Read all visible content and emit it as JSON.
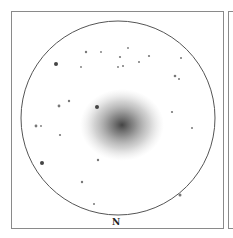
{
  "sketch": {
    "subject": "galaxy-eyepiece-sketch",
    "orientation_label": "N",
    "field_circle": {
      "cx": 118,
      "cy": 118,
      "r": 97,
      "stroke": "#555555"
    },
    "galaxy": {
      "cx": 122,
      "cy": 125,
      "rx": 42,
      "ry": 36,
      "core_color": "#3a3a3a"
    },
    "stars": [
      {
        "x": 86,
        "y": 52,
        "r": 1.2
      },
      {
        "x": 101,
        "y": 52,
        "r": 0.9
      },
      {
        "x": 128,
        "y": 48,
        "r": 0.9
      },
      {
        "x": 120,
        "y": 57,
        "r": 1.1
      },
      {
        "x": 149,
        "y": 56,
        "r": 1.1
      },
      {
        "x": 181,
        "y": 58,
        "r": 1.0
      },
      {
        "x": 56,
        "y": 64,
        "r": 2.0
      },
      {
        "x": 81,
        "y": 67,
        "r": 0.9
      },
      {
        "x": 118,
        "y": 67,
        "r": 0.9
      },
      {
        "x": 123,
        "y": 66,
        "r": 1.0
      },
      {
        "x": 139,
        "y": 62,
        "r": 1.0
      },
      {
        "x": 175,
        "y": 76,
        "r": 1.3
      },
      {
        "x": 179,
        "y": 79,
        "r": 1.0
      },
      {
        "x": 69,
        "y": 101,
        "r": 1.2
      },
      {
        "x": 59,
        "y": 106,
        "r": 1.4
      },
      {
        "x": 97,
        "y": 107,
        "r": 2.0
      },
      {
        "x": 172,
        "y": 112,
        "r": 1.1
      },
      {
        "x": 36,
        "y": 126,
        "r": 1.4
      },
      {
        "x": 41,
        "y": 126,
        "r": 0.9
      },
      {
        "x": 192,
        "y": 128,
        "r": 1.0
      },
      {
        "x": 60,
        "y": 135,
        "r": 1.1
      },
      {
        "x": 98,
        "y": 160,
        "r": 1.2
      },
      {
        "x": 42,
        "y": 163,
        "r": 2.0
      },
      {
        "x": 82,
        "y": 182,
        "r": 1.2
      },
      {
        "x": 180,
        "y": 195,
        "r": 1.5
      },
      {
        "x": 94,
        "y": 204,
        "r": 1.0
      }
    ]
  }
}
